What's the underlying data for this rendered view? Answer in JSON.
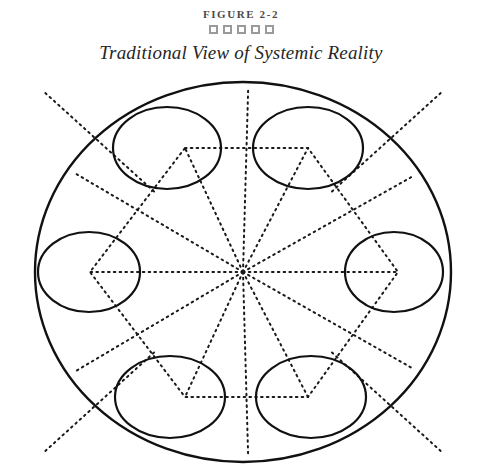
{
  "header": {
    "figure_label": "FIGURE 2-2",
    "title": "Traditional View of Systemic Reality",
    "ornament_icon": "square-ornament",
    "ornament_count": 5,
    "ornament_color": "#9a9a9a"
  },
  "diagram": {
    "name": "traditional-view-of-systemic-reality",
    "stroke_color": "#111111",
    "dotted_color": "#1a1a1a",
    "background": "#ffffff",
    "outer": {
      "cx": 243,
      "cy": 200,
      "rx": 208,
      "ry": 190
    },
    "hub": {
      "cx": 243,
      "cy": 200
    },
    "nodes": [
      {
        "name": "node-top-left",
        "cx": 167,
        "cy": 76,
        "rx": 54,
        "ry": 41,
        "vertex_x": 185,
        "vertex_y": 76
      },
      {
        "name": "node-top-right",
        "cx": 308,
        "cy": 76,
        "rx": 55,
        "ry": 41,
        "vertex_x": 308,
        "vertex_y": 76
      },
      {
        "name": "node-right",
        "cx": 394,
        "cy": 200,
        "rx": 49,
        "ry": 40,
        "vertex_x": 398,
        "vertex_y": 200
      },
      {
        "name": "node-bottom-right",
        "cx": 311,
        "cy": 325,
        "rx": 55,
        "ry": 41,
        "vertex_x": 308,
        "vertex_y": 325
      },
      {
        "name": "node-bottom-left",
        "cx": 170,
        "cy": 325,
        "rx": 55,
        "ry": 41,
        "vertex_x": 185,
        "vertex_y": 325
      },
      {
        "name": "node-left",
        "cx": 89,
        "cy": 200,
        "rx": 51,
        "ry": 40,
        "vertex_x": 90,
        "vertex_y": 200
      }
    ],
    "ray_count": 12,
    "diagonal_extensions": 4
  }
}
